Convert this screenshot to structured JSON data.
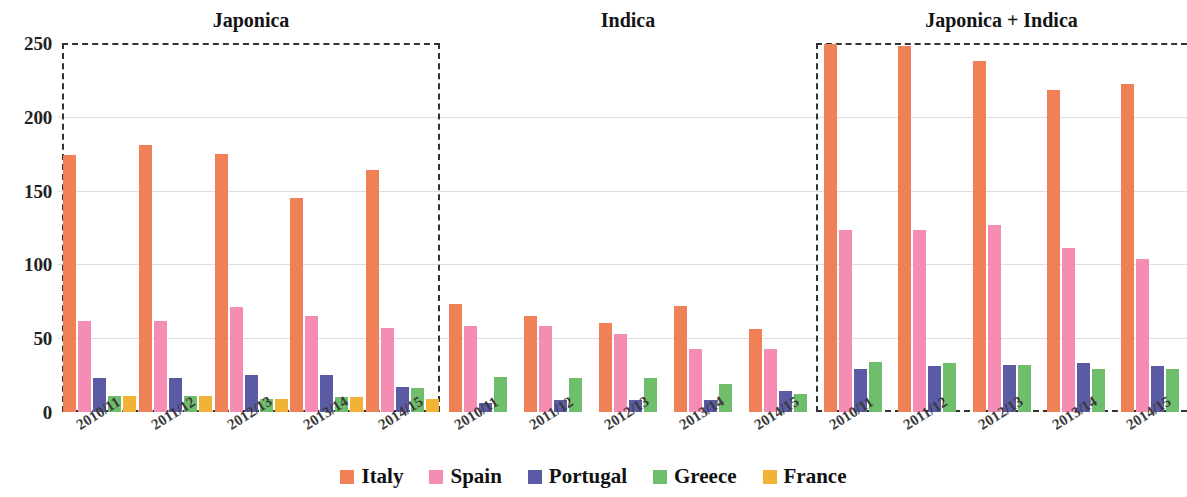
{
  "chart_data": {
    "type": "bar",
    "title": "",
    "xlabel": "",
    "ylabel": "",
    "ylim": [
      0,
      250
    ],
    "yticks": [
      0,
      50,
      100,
      150,
      200,
      250
    ],
    "grid": true,
    "legend_position": "bottom",
    "categories": [
      "2010/11",
      "2011/12",
      "2012/13",
      "2013/14",
      "2014/15"
    ],
    "panels": [
      {
        "title": "Japonica",
        "categories": [
          "2010/11",
          "2011/12",
          "2012/13",
          "2013/14",
          "2014/15"
        ],
        "series": [
          {
            "name": "Italy",
            "values": [
              174,
              181,
              175,
              145,
              164
            ]
          },
          {
            "name": "Spain",
            "values": [
              62,
              62,
              71,
              65,
              57
            ]
          },
          {
            "name": "Portugal",
            "values": [
              23,
              23,
              25,
              25,
              17
            ]
          },
          {
            "name": "Greece",
            "values": [
              11,
              11,
              9,
              10,
              16
            ]
          },
          {
            "name": "France",
            "values": [
              11,
              11,
              9,
              10,
              9
            ]
          }
        ]
      },
      {
        "title": "Indica",
        "categories": [
          "2010/11",
          "2011/12",
          "2012/13",
          "2013/14",
          "2014/15"
        ],
        "series": [
          {
            "name": "Italy",
            "values": [
              73,
              65,
              60,
              72,
              56
            ]
          },
          {
            "name": "Spain",
            "values": [
              58,
              58,
              53,
              43,
              43
            ]
          },
          {
            "name": "Portugal",
            "values": [
              6,
              8,
              8,
              8,
              14
            ]
          },
          {
            "name": "Greece",
            "values": [
              24,
              23,
              23,
              19,
              12
            ]
          },
          {
            "name": "France",
            "values": [
              0,
              0,
              0,
              0,
              0
            ]
          }
        ]
      },
      {
        "title": "Japonica + Indica",
        "categories": [
          "2010/11",
          "2011/12",
          "2012/13",
          "2013/14",
          "2014/15"
        ],
        "series": [
          {
            "name": "Italy",
            "values": [
              249,
              248,
              238,
              218,
              222
            ]
          },
          {
            "name": "Spain",
            "values": [
              123,
              123,
              127,
              111,
              104
            ]
          },
          {
            "name": "Portugal",
            "values": [
              29,
              31,
              32,
              33,
              31
            ]
          },
          {
            "name": "Greece",
            "values": [
              34,
              33,
              32,
              29,
              29
            ]
          },
          {
            "name": "France",
            "values": [
              0,
              0,
              0,
              0,
              0
            ]
          }
        ]
      }
    ],
    "legend": [
      {
        "label": "Italy",
        "color": "#F08055"
      },
      {
        "label": "Spain",
        "color": "#F58CB3"
      },
      {
        "label": "Portugal",
        "color": "#5B5BA5"
      },
      {
        "label": "Greece",
        "color": "#6FBE6C"
      },
      {
        "label": "France",
        "color": "#F2B235"
      }
    ]
  },
  "colors": {
    "italy": "#F08055",
    "spain": "#F58CB3",
    "portugal": "#5B5BA5",
    "greece": "#6FBE6C",
    "france": "#F2B235",
    "gridline": "#d8d8d8",
    "axis": "#333333",
    "text": "#1a1a1a"
  }
}
